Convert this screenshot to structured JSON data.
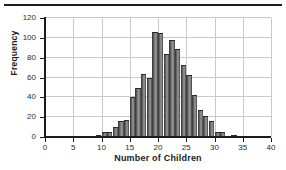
{
  "figure": {
    "has_top_rule": true,
    "background_color": "#ffffff",
    "bar_color": "#7e7e7e",
    "bar_edge_color": "#2a2a2a",
    "grid_color": "#c9c9c9",
    "axis_color": "#1c1c1c"
  },
  "chart_data": {
    "type": "bar",
    "title": "",
    "xlabel": "Number of Children",
    "ylabel": "Frequency",
    "xlim": [
      0,
      40
    ],
    "ylim": [
      0,
      120
    ],
    "xticks": [
      0,
      5,
      10,
      15,
      20,
      25,
      30,
      35,
      40
    ],
    "yticks": [
      0,
      20,
      40,
      60,
      80,
      100,
      120
    ],
    "xticklabels": [
      "0",
      "5",
      "10",
      "15",
      "20",
      "25",
      "30",
      "35",
      "40"
    ],
    "yticklabels": [
      "0",
      "20",
      "40",
      "60",
      "80",
      "100",
      "120"
    ],
    "grid": true,
    "grid_axis": "both",
    "legend": false,
    "bin_width": 1,
    "categories": [
      9,
      10,
      11,
      12,
      13,
      14,
      15,
      16,
      17,
      18,
      19,
      20,
      21,
      22,
      23,
      24,
      25,
      26,
      27,
      28,
      29,
      30,
      31,
      32,
      33
    ],
    "values": [
      2,
      5,
      5,
      10,
      16,
      17,
      40,
      49,
      64,
      60,
      106,
      105,
      84,
      98,
      89,
      73,
      63,
      42,
      27,
      21,
      16,
      5,
      5,
      1,
      2
    ],
    "series": [
      {
        "name": "Frequency",
        "values": [
          2,
          5,
          5,
          10,
          16,
          17,
          40,
          49,
          64,
          60,
          106,
          105,
          84,
          98,
          89,
          73,
          63,
          42,
          27,
          21,
          16,
          5,
          5,
          1,
          2
        ]
      }
    ]
  }
}
